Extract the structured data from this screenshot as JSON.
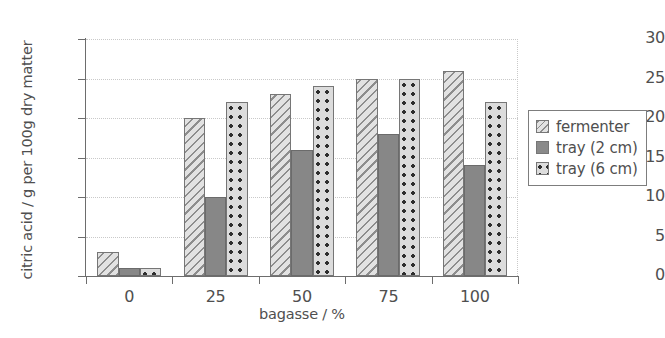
{
  "chart_data": {
    "type": "bar",
    "title": "",
    "xlabel": "bagasse / %",
    "ylabel": "citric acid / g per 100g dry matter",
    "categories": [
      "0",
      "25",
      "50",
      "75",
      "100"
    ],
    "series": [
      {
        "name": "fermenter",
        "key": "fermenter",
        "values": [
          3,
          20,
          23,
          25,
          26
        ]
      },
      {
        "name": "tray (2 cm)",
        "key": "tray2",
        "values": [
          1,
          10,
          16,
          18,
          14
        ]
      },
      {
        "name": "tray (6 cm)",
        "key": "tray6",
        "values": [
          1,
          22,
          24,
          25,
          22
        ]
      }
    ],
    "ylim": [
      0,
      30
    ],
    "yticks": [
      0,
      5,
      10,
      15,
      20,
      25,
      30
    ],
    "ytick_labels": [
      "0",
      "5",
      "10",
      "15",
      "20",
      "25",
      "30"
    ],
    "xtick_labels": [
      "0",
      "25",
      "50",
      "75",
      "100"
    ],
    "grid": "horizontal-dotted",
    "legend_position": "right-outside",
    "colors": {
      "fermenter_fill": "#e2e2e2",
      "fermenter_hatch": "#8d8d8d",
      "tray2_fill": "#878787",
      "tray6_fill": "#dcdcdc",
      "tray6_dots": "#2e2e2e",
      "axis": "#6d6d6d",
      "grid": "#c9c9c9",
      "text": "#4f4f4f"
    }
  },
  "legend": {
    "items": [
      {
        "label": "fermenter",
        "key": "fermenter"
      },
      {
        "label": "tray (2 cm)",
        "key": "tray2"
      },
      {
        "label": "tray (6 cm)",
        "key": "tray6"
      }
    ]
  }
}
